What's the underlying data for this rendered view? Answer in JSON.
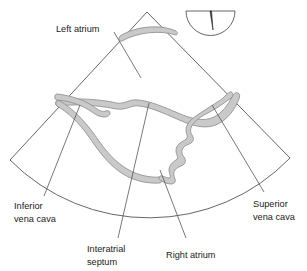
{
  "figure": {
    "type": "medical-ultrasound-diagram",
    "modality": "echocardiography sector scan",
    "view": "bicaval view of the right atrium and interatrial septum",
    "colors": {
      "background": "#ffffff",
      "outline": "#555555",
      "tissue_fill": "#c9c9c9",
      "tissue_stroke": "#8a8a8a",
      "leader_line": "#555555",
      "text": "#1a1a1a"
    },
    "labels": [
      {
        "id": "left-atrium",
        "text": "Left atrium",
        "lines": [
          "Left atrium"
        ]
      },
      {
        "id": "inferior-vena-cava",
        "text": "Inferior vena cava",
        "lines": [
          "Inferior",
          "vena cava"
        ]
      },
      {
        "id": "superior-vena-cava",
        "text": "Superior vena cava",
        "lines": [
          "Superior",
          "vena cava"
        ]
      },
      {
        "id": "interatrial-septum",
        "text": "Interatrial septum",
        "lines": [
          "Interatrial",
          "septum"
        ]
      },
      {
        "id": "right-atrium",
        "text": "Right atrium",
        "lines": [
          "Right atrium"
        ]
      }
    ],
    "label_text": {
      "left_atrium": "Left atrium",
      "inferior_vena_cava_line1": "Inferior",
      "inferior_vena_cava_line2": "vena cava",
      "superior_vena_cava_line1": "Superior",
      "superior_vena_cava_line2": "vena cava",
      "interatrial_septum_line1": "Interatrial",
      "interatrial_septum_line2": "septum",
      "right_atrium": "Right atrium"
    },
    "probe_marker": {
      "id": "transducer-orientation-icon",
      "shape": "semicircle-with-notch",
      "description": "probe orientation marker, flat edge up with wedge notch"
    },
    "structures": [
      {
        "id": "scan-sector",
        "name": "ultrasound sector outline"
      },
      {
        "id": "left-atrium-wall",
        "name": "left atrium far wall band"
      },
      {
        "id": "atrial-roof-band",
        "name": "atrial roof tissue band"
      },
      {
        "id": "ivc-band",
        "name": "inferior vena cava wall band"
      },
      {
        "id": "ra-wall-band",
        "name": "right atrial free wall band"
      },
      {
        "id": "septum-band",
        "name": "interatrial septum band"
      }
    ]
  }
}
